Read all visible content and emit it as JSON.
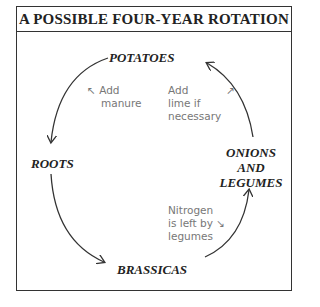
{
  "title": "A POSSIBLE FOUR-YEAR ROTATION",
  "crops": {
    "potatoes": "POTATOES",
    "roots": "ROOTS",
    "brassicas": "BRASSICAS",
    "onions_line1": "ONIONS",
    "onions_line2": "AND",
    "onions_line3": "LEGUMES"
  },
  "notes": {
    "manure_arrow": "↖",
    "manure_line1": "Add",
    "manure_line2": "manure",
    "lime_line1": "Add",
    "lime_line2": "lime if",
    "lime_line3": "necessary",
    "lime_arrow": "↗",
    "nitrogen_line1": "Nitrogen",
    "nitrogen_line2": "is left by",
    "nitrogen_arrow": "↘",
    "nitrogen_line3": "legumes"
  },
  "colors": {
    "line": "#333333",
    "note": "#777777"
  }
}
